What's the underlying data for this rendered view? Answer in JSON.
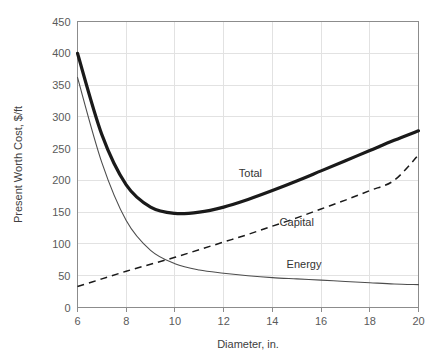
{
  "chart_data": {
    "type": "line",
    "title": "",
    "xlabel": "Diameter, in.",
    "ylabel": "Present Worth Cost, $/ft",
    "xlim": [
      6,
      20
    ],
    "ylim": [
      0,
      450
    ],
    "xticks": [
      6,
      8,
      10,
      12,
      14,
      16,
      18,
      20
    ],
    "yticks": [
      0,
      50,
      100,
      150,
      200,
      250,
      300,
      350,
      400,
      450
    ],
    "grid": "horizontal-and-vertical",
    "legend": "inline-annotations",
    "x": [
      6,
      7,
      8,
      9,
      10,
      11,
      12,
      13,
      14,
      15,
      16,
      17,
      18,
      19,
      20
    ],
    "series": [
      {
        "name": "Total",
        "style": "thick-solid",
        "color": "#1a1a1a",
        "values": [
          400,
          272,
          193,
          158,
          148,
          150,
          158,
          170,
          184,
          199,
          215,
          231,
          247,
          263,
          278
        ]
      },
      {
        "name": "Capital",
        "style": "dashed",
        "color": "#1a1a1a",
        "values": [
          33,
          45,
          57,
          68,
          79,
          91,
          103,
          115,
          128,
          141,
          155,
          169,
          184,
          200,
          240
        ]
      },
      {
        "name": "Energy",
        "style": "thin-solid",
        "color": "#4d4d4d",
        "values": [
          362,
          228,
          137,
          90,
          69,
          59,
          54,
          50,
          47,
          45,
          43,
          41,
          39,
          37,
          36
        ]
      }
    ],
    "annotations": [
      {
        "text": "Total",
        "x_value": 13.1,
        "y_value": 205
      },
      {
        "text": "Capital",
        "x_value": 15.0,
        "y_value": 128
      },
      {
        "text": "Energy",
        "x_value": 15.3,
        "y_value": 62
      }
    ]
  }
}
